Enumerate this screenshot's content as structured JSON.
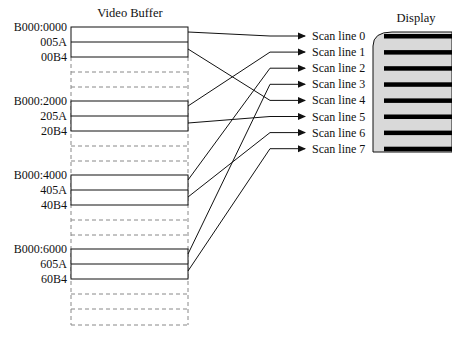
{
  "buffer": {
    "title": "Video Buffer",
    "banks": [
      {
        "addresses": [
          "B000:0000",
          "005A",
          "00B4"
        ],
        "targets": [
          0,
          4
        ]
      },
      {
        "addresses": [
          "B000:2000",
          "205A",
          "20B4"
        ],
        "targets": [
          1,
          5
        ]
      },
      {
        "addresses": [
          "B000:4000",
          "405A",
          "40B4"
        ],
        "targets": [
          2,
          6
        ]
      },
      {
        "addresses": [
          "B000:6000",
          "605A",
          "60B4"
        ],
        "targets": [
          3,
          7
        ]
      }
    ]
  },
  "scan_lines": [
    "Scan line 0",
    "Scan line 1",
    "Scan line 2",
    "Scan line 3",
    "Scan line 4",
    "Scan line 5",
    "Scan line 6",
    "Scan line 7"
  ],
  "display": {
    "title": "Display",
    "bezel_color": "#d9d9d9",
    "line_color": "#000000"
  }
}
